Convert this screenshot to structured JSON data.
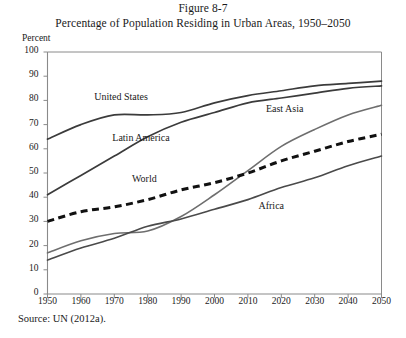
{
  "figure": {
    "number": "Figure 8-7",
    "title": "Percentage of Population Residing in Urban Areas, 1950–2050",
    "source": "Source: UN (2012a).",
    "axis_unit": "Percent"
  },
  "chart_data": {
    "type": "line",
    "title": "Percentage of Population Residing in Urban Areas, 1950–2050",
    "subtitle": "Figure 8-7",
    "xlabel": "",
    "ylabel": "Percent",
    "xlim": [
      1950,
      2050
    ],
    "ylim": [
      0,
      100
    ],
    "grid": false,
    "legend": "inline-labels",
    "xticks": [
      1950,
      1960,
      1970,
      1980,
      1990,
      2000,
      2010,
      2020,
      2030,
      2040,
      2050
    ],
    "yticks": [
      0,
      10,
      20,
      30,
      40,
      50,
      60,
      70,
      80,
      90,
      100
    ],
    "x": [
      1950,
      1960,
      1970,
      1980,
      1990,
      2000,
      2010,
      2020,
      2030,
      2040,
      2050
    ],
    "series": [
      {
        "name": "United States",
        "style": "solid",
        "color": "#3b3b3b",
        "width": 1.7,
        "label_x": 1972,
        "label_y": 81,
        "values": [
          64,
          70,
          74,
          74,
          75,
          79,
          82,
          84,
          86,
          87,
          88
        ]
      },
      {
        "name": "Latin America",
        "style": "solid",
        "color": "#3b3b3b",
        "width": 1.7,
        "label_x": 1978,
        "label_y": 64,
        "values": [
          41,
          49,
          57,
          65,
          71,
          75,
          79,
          81,
          83,
          85,
          86
        ]
      },
      {
        "name": "East Asia",
        "style": "solid",
        "color": "#6e6e6e",
        "width": 1.6,
        "label_x": 2021,
        "label_y": 76,
        "values": [
          17,
          22,
          25,
          26,
          32,
          41,
          51,
          61,
          68,
          74,
          78
        ]
      },
      {
        "name": "World",
        "style": "dashed",
        "color": "#111111",
        "width": 3.0,
        "label_x": 1979,
        "label_y": 47,
        "values": [
          30,
          34,
          36,
          39,
          43,
          46,
          50,
          55,
          59,
          63,
          66
        ]
      },
      {
        "name": "Africa",
        "style": "solid",
        "color": "#4a4a4a",
        "width": 1.6,
        "label_x": 2017,
        "label_y": 36,
        "values": [
          14,
          19,
          23,
          28,
          31,
          35,
          39,
          44,
          48,
          53,
          57
        ]
      }
    ],
    "annotations": [
      {
        "text": "East Asia crosses World near 2007 at about 50 percent"
      }
    ]
  }
}
